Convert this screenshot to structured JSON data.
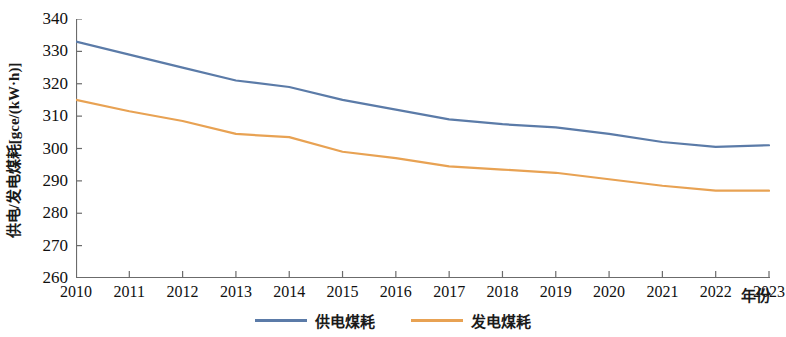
{
  "chart_data": {
    "type": "line",
    "title": "",
    "xlabel": "年份",
    "ylabel": "供电/发电煤耗[gce/(kW·h)]",
    "categories": [
      "2010",
      "2011",
      "2012",
      "2013",
      "2014",
      "2015",
      "2016",
      "2017",
      "2018",
      "2019",
      "2020",
      "2021",
      "2022",
      "2023"
    ],
    "x": [
      2010,
      2011,
      2012,
      2013,
      2014,
      2015,
      2016,
      2017,
      2018,
      2019,
      2020,
      2021,
      2022,
      2023
    ],
    "xlim": [
      2010,
      2023
    ],
    "ylim": [
      260,
      340
    ],
    "yticks": [
      260,
      270,
      280,
      290,
      300,
      310,
      320,
      330,
      340
    ],
    "ytick_step": 10,
    "grid": false,
    "legend_position": "bottom-center",
    "series": [
      {
        "name": "供电煤耗",
        "color": "#5B7BA8",
        "values": [
          333.0,
          329.0,
          325.0,
          321.0,
          319.0,
          315.0,
          312.0,
          309.0,
          307.5,
          306.5,
          304.5,
          302.0,
          300.5,
          301.0
        ]
      },
      {
        "name": "发电煤耗",
        "color": "#E8A253",
        "values": [
          315.0,
          311.5,
          308.5,
          304.5,
          303.5,
          299.0,
          297.0,
          294.5,
          293.5,
          292.5,
          290.5,
          288.5,
          287.0,
          287.0
        ]
      }
    ]
  },
  "axes": {
    "y_tick_labels": [
      "340",
      "330",
      "320",
      "310",
      "300",
      "290",
      "280",
      "270",
      "260"
    ],
    "x_tick_labels": [
      "2010",
      "2011",
      "2012",
      "2013",
      "2014",
      "2015",
      "2016",
      "2017",
      "2018",
      "2019",
      "2020",
      "2021",
      "2022",
      "2023"
    ],
    "x_axis_title": "年份",
    "y_axis_title": "供电/发电煤耗[gce/(kW·h)]"
  },
  "legend": {
    "items": [
      {
        "label": "供电煤耗",
        "color": "#5B7BA8"
      },
      {
        "label": "发电煤耗",
        "color": "#E8A253"
      }
    ]
  },
  "colors": {
    "series_supply": "#5B7BA8",
    "series_generation": "#E8A253",
    "axis": "#6b6b6b",
    "text": "#101010",
    "background": "#ffffff"
  }
}
